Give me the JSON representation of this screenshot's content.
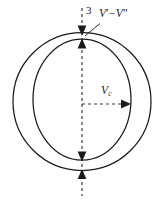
{
  "figure": {
    "name": "sphere-with-inner-ellipse-diagram",
    "background_color": "#ffffff",
    "stroke_color": "#1a1a1a",
    "dashed_color": "#3a3a3a",
    "width": 166,
    "height": 201,
    "labels": {
      "thickness": "3",
      "potential_difference_v": "V",
      "potential_difference_op": "−",
      "potential_difference_prime": "′",
      "potential_difference_double_prime": "″",
      "vc_symbol": "V",
      "vc_subscript": "c"
    },
    "noise_text": "",
    "shapes": {
      "outer_circle": {
        "cx": 82,
        "cy": 101.5,
        "r": 69
      },
      "inner_ellipse": {
        "cx": 82,
        "cy": 99.5,
        "rx": 49,
        "ry": 60.5
      }
    },
    "axes": {
      "vertical_dashed_line": {
        "x": 82,
        "y1": 8,
        "y2": 196
      },
      "horizontal_dashed_arrow": {
        "x1": 82,
        "y": 104,
        "x2": 129
      }
    },
    "arrow_markers": {
      "top_outer_down": {
        "x": 82,
        "y": 33
      },
      "top_inner_up": {
        "x": 82,
        "y": 40
      },
      "bottom_inner_down": {
        "x": 82,
        "y": 160
      },
      "bottom_outer_up": {
        "x": 82,
        "y": 170
      },
      "vc_right": {
        "x": 129,
        "y": 104
      }
    },
    "leader_line": {
      "x1": 98,
      "y1": 24,
      "x2": 84,
      "y2": 35
    }
  }
}
